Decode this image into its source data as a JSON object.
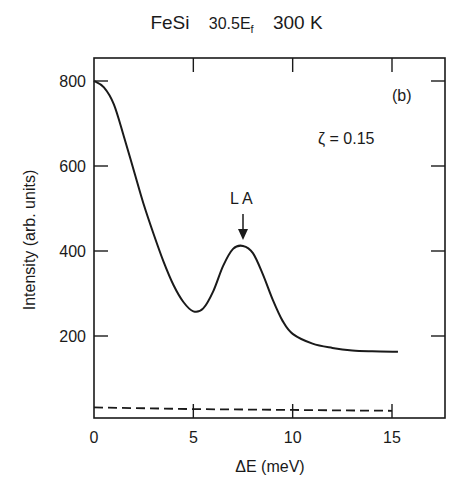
{
  "chart_data": {
    "type": "line",
    "title_parts": {
      "material": "FeSi",
      "momentum": "30.5E",
      "momentum_sub": "f",
      "temperature": "300 K"
    },
    "panel_label": "(b)",
    "annotations": [
      {
        "text": "ζ = 0.15",
        "x": 13,
        "y": 640
      },
      {
        "text": "LA",
        "x": 7.5,
        "y": 480,
        "arrow_to": [
          7.5,
          415
        ]
      }
    ],
    "xlabel": "ΔE (meV)",
    "ylabel": "Intensity (arb. units)",
    "xlim": [
      0,
      17.6
    ],
    "ylim": [
      0,
      850
    ],
    "xticks": [
      0,
      5,
      10,
      15
    ],
    "yticks": [
      200,
      400,
      600,
      800
    ],
    "grid": false,
    "legend": null,
    "series": [
      {
        "name": "fit (solid)",
        "style": "solid",
        "x": [
          0,
          0.5,
          1,
          1.5,
          2,
          2.5,
          3,
          3.5,
          4,
          4.5,
          5,
          5.5,
          6,
          6.5,
          7,
          7.5,
          8,
          8.5,
          9,
          9.5,
          10,
          11,
          12,
          13,
          14,
          15.3
        ],
        "y": [
          800,
          785,
          745,
          670,
          590,
          510,
          440,
          375,
          320,
          280,
          258,
          265,
          305,
          365,
          405,
          412,
          395,
          345,
          285,
          235,
          205,
          182,
          172,
          166,
          164,
          163
        ]
      },
      {
        "name": "background (dashed)",
        "style": "dashed",
        "x": [
          0,
          5,
          10,
          15
        ],
        "y": [
          32,
          28,
          26,
          24
        ]
      }
    ]
  }
}
